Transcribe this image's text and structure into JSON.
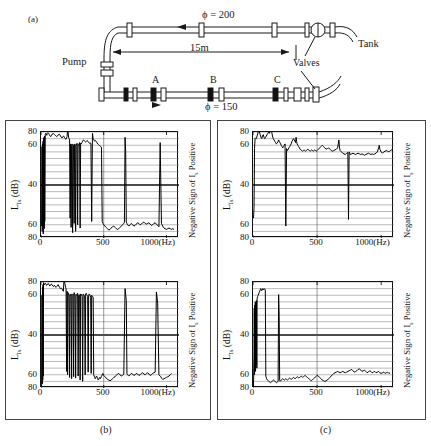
{
  "figure": {
    "panel_a_label": "(a)",
    "panel_b_label": "(b)",
    "panel_c_label": "(c)"
  },
  "schematic": {
    "pump_label": "Pump",
    "tank_label": "Tank",
    "valves_label": "Valves",
    "length_label": "15m",
    "upper_pipe_label": "ϕ = 200",
    "lower_pipe_label": "ϕ = 150",
    "tap_a": "A",
    "tap_b": "B",
    "tap_c": "C"
  },
  "axes": {
    "y_label": "L",
    "y_label_sub": "Is",
    "y_label_unit": " (dB)",
    "y_ticks": [
      "80",
      "60",
      "40",
      "60",
      "80"
    ],
    "x_ticks": [
      "0",
      "500",
      "1000"
    ],
    "x_unit": "(Hz)",
    "right_label_pre": "Negative Sign of I",
    "right_label_sub": "s",
    "right_label_post": " Positive",
    "ylim": [
      80,
      80
    ],
    "xlim": [
      0,
      1100
    ],
    "grid": true
  },
  "chart_data": [
    {
      "type": "line",
      "id": "point-b",
      "title": "Point B",
      "subtitle": "",
      "xlabel": "(Hz)",
      "ylabel": "L_Is (dB)",
      "xlim": [
        0,
        1100
      ],
      "ylim": [
        -80,
        80
      ],
      "grid": true,
      "note": "Mirrored dB axis; positive half = positive sign of intensity, lower half = negative sign",
      "x": [
        5,
        8,
        10,
        12,
        14,
        16,
        18,
        20,
        22,
        24,
        26,
        28,
        30,
        34,
        38,
        42,
        46,
        50,
        55,
        60,
        66,
        72,
        78,
        84,
        90,
        96,
        102,
        108,
        114,
        120,
        126,
        132,
        138,
        144,
        150,
        156,
        162,
        168,
        174,
        180,
        186,
        192,
        198,
        204,
        208,
        212,
        216,
        220,
        224,
        228,
        232,
        236,
        240,
        244,
        248,
        252,
        256,
        260,
        264,
        268,
        272,
        276,
        280,
        284,
        288,
        292,
        296,
        300,
        304,
        308,
        312,
        316,
        320,
        326,
        332,
        338,
        344,
        350,
        356,
        362,
        368,
        374,
        380,
        386,
        392,
        398,
        404,
        410,
        416,
        422,
        428,
        434,
        440,
        446,
        452,
        458,
        464,
        470,
        476,
        482,
        488,
        494,
        500,
        510,
        520,
        530,
        540,
        550,
        560,
        570,
        580,
        590,
        600,
        610,
        620,
        630,
        640,
        650,
        660,
        665,
        670,
        675,
        680,
        685,
        690,
        700,
        710,
        720,
        730,
        740,
        750,
        760,
        770,
        780,
        790,
        800,
        810,
        820,
        830,
        840,
        850,
        860,
        870,
        880,
        890,
        900,
        910,
        920,
        930,
        940,
        950,
        960,
        965,
        970,
        975,
        980,
        990,
        1000,
        1010,
        1020,
        1030,
        1040,
        1050,
        1060,
        1070,
        1080,
        1090
      ],
      "y": [
        -62,
        58,
        -70,
        62,
        -58,
        66,
        -74,
        70,
        -60,
        72,
        -66,
        74,
        -55,
        76,
        78,
        77,
        75,
        78,
        79,
        78,
        76,
        74,
        73,
        75,
        77,
        78,
        77,
        76,
        75,
        74,
        73,
        74,
        76,
        77,
        76,
        74,
        72,
        71,
        73,
        74,
        72,
        70,
        69,
        71,
        73,
        85,
        80,
        72,
        70,
        68,
        -50,
        62,
        -64,
        60,
        62,
        -72,
        61,
        60,
        -58,
        62,
        61,
        -70,
        60,
        62,
        63,
        -60,
        61,
        60,
        62,
        64,
        -65,
        63,
        62,
        64,
        66,
        68,
        67,
        66,
        65,
        66,
        67,
        66,
        64,
        63,
        64,
        62,
        -55,
        78,
        70,
        68,
        66,
        67,
        66,
        64,
        62,
        61,
        60,
        59,
        58,
        57,
        -55,
        -58,
        -60,
        -62,
        -64,
        -66,
        -68,
        -67,
        -65,
        -63,
        -62,
        -64,
        -66,
        -67,
        -66,
        -64,
        -62,
        -60,
        -58,
        -56,
        72,
        50,
        -56,
        -58,
        -60,
        -62,
        -60,
        -58,
        -60,
        -62,
        -61,
        -59,
        -57,
        -58,
        -60,
        -59,
        -57,
        -56,
        -58,
        -59,
        -58,
        -57,
        -59,
        -61,
        -60,
        -58,
        -57,
        -59,
        -61,
        -63,
        64,
        -58,
        -60,
        -62,
        -64,
        -65,
        -66,
        -67,
        -66,
        -65,
        -66,
        -67,
        -66,
        -67
      ]
    },
    {
      "type": "line",
      "id": "point-c",
      "title": "Point C",
      "subtitle": "",
      "xlabel": "(Hz)",
      "ylabel": "L_Is (dB)",
      "xlim": [
        0,
        1100
      ],
      "ylim": [
        -80,
        80
      ],
      "grid": true,
      "x": [
        5,
        8,
        10,
        12,
        14,
        16,
        18,
        20,
        24,
        28,
        32,
        36,
        40,
        46,
        52,
        58,
        64,
        70,
        76,
        82,
        88,
        94,
        100,
        106,
        112,
        118,
        124,
        130,
        136,
        142,
        148,
        154,
        160,
        166,
        172,
        178,
        184,
        190,
        196,
        200,
        204,
        208,
        212,
        216,
        220,
        224,
        228,
        232,
        236,
        240,
        244,
        248,
        252,
        256,
        260,
        264,
        268,
        272,
        276,
        280,
        284,
        288,
        292,
        296,
        300,
        304,
        308,
        312,
        316,
        320,
        324,
        328,
        332,
        336,
        340,
        344,
        348,
        352,
        356,
        360,
        364,
        368,
        372,
        376,
        380,
        384,
        388,
        392,
        396,
        400,
        404,
        408,
        412,
        416,
        420,
        424,
        428,
        432,
        436,
        440,
        444,
        448,
        452,
        456,
        460,
        464,
        468,
        472,
        476,
        480,
        484,
        488,
        492,
        496,
        500,
        510,
        520,
        530,
        540,
        550,
        560,
        570,
        580,
        590,
        600,
        610,
        620,
        630,
        640,
        650,
        660,
        670,
        680,
        685,
        690,
        695,
        700,
        710,
        720,
        730,
        740,
        750,
        760,
        770,
        780,
        790,
        800,
        810,
        820,
        830,
        840,
        850,
        860,
        870,
        880,
        890,
        900,
        910,
        920,
        930,
        940,
        950,
        955,
        960,
        965,
        970,
        980,
        990,
        1000,
        1010,
        1020,
        1030,
        1040,
        1050,
        1060,
        1070,
        1080,
        1090
      ],
      "y": [
        -78,
        60,
        -74,
        72,
        -68,
        76,
        -62,
        79,
        78,
        76,
        77,
        78,
        76,
        75,
        77,
        78,
        76,
        74,
        75,
        77,
        76,
        74,
        73,
        75,
        74,
        72,
        73,
        74,
        76,
        74,
        72,
        70,
        71,
        70,
        68,
        66,
        85,
        78,
        72,
        70,
        -55,
        66,
        -60,
        64,
        62,
        60,
        -64,
        61,
        60,
        62,
        -66,
        60,
        61,
        62,
        -63,
        64,
        62,
        60,
        -65,
        61,
        60,
        62,
        63,
        -62,
        60,
        61,
        59,
        -68,
        62,
        60,
        61,
        58,
        -70,
        62,
        61,
        60,
        59,
        -60,
        62,
        63,
        61,
        60,
        58,
        -56,
        60,
        62,
        61,
        59,
        57,
        -58,
        60,
        59,
        58,
        56,
        -60,
        -62,
        -64,
        -66,
        -65,
        -63,
        -62,
        -64,
        -66,
        -68,
        -67,
        -65,
        -64,
        -66,
        -65,
        -63,
        -62,
        -60,
        -58,
        -59,
        -61,
        -63,
        -65,
        -67,
        -68,
        -69,
        -68,
        -66,
        -64,
        -63,
        -61,
        -59,
        -58,
        -60,
        -62,
        -61,
        -59,
        70,
        52,
        -58,
        -60,
        -61,
        -62,
        -60,
        -58,
        -59,
        -61,
        -60,
        -58,
        -59,
        -61,
        -60,
        -58,
        -57,
        -59,
        -60,
        -58,
        -57,
        -59,
        -61,
        -60,
        -58,
        -57,
        -56,
        65,
        48,
        -60,
        -62,
        -63,
        -65,
        -66,
        -67,
        -66,
        -65,
        -64,
        -63,
        -62,
        -60,
        -58
      ]
    },
    {
      "type": "line",
      "id": "point-a-silencer-b",
      "title": "Point A",
      "subtitle": "Silencer at B",
      "xlabel": "(Hz)",
      "ylabel": "L_Is (dB)",
      "xlim": [
        0,
        1100
      ],
      "ylim": [
        -80,
        80
      ],
      "grid": true,
      "x": [
        4,
        8,
        12,
        16,
        20,
        26,
        32,
        38,
        44,
        50,
        56,
        62,
        68,
        74,
        80,
        86,
        92,
        98,
        104,
        110,
        116,
        122,
        128,
        134,
        140,
        146,
        152,
        158,
        164,
        170,
        176,
        182,
        188,
        194,
        200,
        205,
        210,
        215,
        220,
        226,
        232,
        238,
        244,
        250,
        256,
        262,
        268,
        274,
        280,
        286,
        292,
        298,
        304,
        310,
        316,
        322,
        328,
        332,
        336,
        340,
        344,
        350,
        356,
        362,
        368,
        374,
        380,
        386,
        392,
        398,
        404,
        410,
        416,
        422,
        428,
        434,
        440,
        446,
        452,
        458,
        464,
        470,
        476,
        482,
        488,
        494,
        500,
        510,
        520,
        530,
        540,
        550,
        560,
        570,
        580,
        590,
        600,
        610,
        620,
        630,
        640,
        650,
        660,
        670,
        675,
        680,
        690,
        700,
        710,
        720,
        730,
        740,
        745,
        750,
        755,
        760,
        770,
        780,
        790,
        800,
        810,
        820,
        830,
        840,
        850,
        860,
        870,
        880,
        890,
        900,
        910,
        920,
        930,
        940,
        950,
        960,
        970,
        980,
        985,
        990,
        1000,
        1010,
        1020,
        1030,
        1040,
        1050,
        1060,
        1070,
        1080,
        1090
      ],
      "y": [
        -50,
        -35,
        55,
        70,
        71,
        70,
        74,
        78,
        82,
        80,
        76,
        72,
        70,
        74,
        76,
        72,
        70,
        72,
        74,
        76,
        78,
        80,
        78,
        82,
        87,
        80,
        74,
        70,
        68,
        66,
        64,
        62,
        63,
        65,
        68,
        66,
        64,
        62,
        60,
        58,
        56,
        58,
        60,
        62,
        -62,
        55,
        52,
        54,
        56,
        58,
        60,
        62,
        66,
        68,
        70,
        68,
        66,
        64,
        72,
        66,
        62,
        60,
        58,
        56,
        54,
        53,
        52,
        51,
        52,
        53,
        52,
        51,
        52,
        53,
        54,
        53,
        52,
        51,
        52,
        53,
        52,
        51,
        52,
        53,
        52,
        51,
        52,
        54,
        56,
        58,
        60,
        58,
        56,
        54,
        55,
        56,
        54,
        52,
        51,
        52,
        53,
        54,
        56,
        68,
        56,
        52,
        50,
        48,
        47,
        46,
        48,
        49,
        -52,
        50,
        48,
        46,
        47,
        48,
        47,
        46,
        47,
        48,
        47,
        46,
        47,
        46,
        45,
        46,
        47,
        48,
        47,
        46,
        47,
        46,
        47,
        48,
        50,
        56,
        60,
        54,
        50,
        48,
        50,
        51,
        52,
        51,
        50,
        52,
        53,
        52
      ]
    },
    {
      "type": "line",
      "id": "point-c-silencer-b",
      "title": "Point C",
      "subtitle": "Silencer at B",
      "xlabel": "(Hz)",
      "ylabel": "L_Is (dB)",
      "xlim": [
        0,
        1100
      ],
      "ylim": [
        -80,
        80
      ],
      "grid": true,
      "x": [
        4,
        6,
        8,
        10,
        12,
        14,
        16,
        18,
        20,
        22,
        24,
        26,
        28,
        30,
        32,
        36,
        40,
        44,
        48,
        52,
        56,
        60,
        64,
        68,
        72,
        76,
        80,
        84,
        88,
        92,
        96,
        100,
        106,
        112,
        118,
        124,
        130,
        136,
        142,
        148,
        154,
        160,
        166,
        172,
        178,
        184,
        190,
        196,
        200,
        204,
        208,
        212,
        216,
        220,
        226,
        232,
        238,
        244,
        250,
        256,
        262,
        268,
        274,
        280,
        286,
        292,
        298,
        304,
        310,
        316,
        322,
        328,
        334,
        340,
        346,
        352,
        358,
        364,
        370,
        376,
        382,
        388,
        394,
        400,
        406,
        412,
        418,
        424,
        430,
        436,
        442,
        448,
        454,
        460,
        466,
        472,
        478,
        484,
        490,
        496,
        500,
        510,
        520,
        530,
        540,
        550,
        560,
        570,
        580,
        590,
        600,
        610,
        620,
        630,
        640,
        650,
        660,
        670,
        680,
        690,
        700,
        710,
        720,
        730,
        740,
        750,
        760,
        770,
        780,
        790,
        800,
        810,
        820,
        830,
        840,
        850,
        860,
        870,
        880,
        890,
        900,
        910,
        920,
        930,
        940,
        950,
        960,
        970,
        980,
        990,
        1000,
        1010,
        1020,
        1030,
        1040,
        1050,
        1060,
        1070,
        1080,
        1090
      ],
      "y": [
        -78,
        -50,
        -30,
        40,
        -60,
        45,
        -40,
        50,
        -55,
        48,
        -45,
        52,
        30,
        -50,
        55,
        58,
        60,
        62,
        64,
        66,
        68,
        70,
        69,
        67,
        68,
        70,
        69,
        68,
        70,
        69,
        68,
        -62,
        -66,
        -68,
        -69,
        -70,
        -71,
        -72,
        -71,
        -70,
        -69,
        -68,
        -69,
        -70,
        -71,
        -72,
        -71,
        -70,
        61,
        30,
        -68,
        -70,
        -69,
        -68,
        -67,
        -66,
        -67,
        -68,
        -67,
        -66,
        -67,
        -68,
        -67,
        -66,
        -65,
        -66,
        -67,
        -66,
        -65,
        -64,
        -65,
        -66,
        -65,
        -64,
        -63,
        -64,
        -65,
        -64,
        -63,
        -62,
        -63,
        -64,
        -63,
        -62,
        -61,
        -62,
        -63,
        -64,
        -65,
        -66,
        -67,
        -68,
        -69,
        -68,
        -67,
        -66,
        -65,
        -64,
        -63,
        -62,
        -61,
        -62,
        -64,
        -66,
        -68,
        -69,
        -70,
        -69,
        -68,
        -66,
        -64,
        -62,
        -60,
        -58,
        -57,
        -56,
        -55,
        -56,
        -57,
        -56,
        -55,
        -56,
        -57,
        -56,
        -55,
        -54,
        -53,
        -52,
        -54,
        -56,
        -55,
        -54,
        -52,
        -51,
        -53,
        -55,
        -54,
        -53,
        -55,
        -57,
        -56,
        -54,
        -55,
        -57,
        -56,
        -55,
        -57,
        -56,
        -55,
        -57,
        -58,
        -57,
        -56,
        -58,
        -57,
        -56,
        -58,
        -57
      ]
    }
  ]
}
